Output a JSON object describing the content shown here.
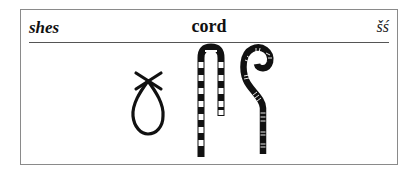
{
  "entry": {
    "transliteration": "shes",
    "meaning": "cord",
    "phonetic": "šś",
    "glyphs": [
      "loop-cord-icon",
      "striped-hook-staff-icon",
      "striped-crook-staff-icon"
    ]
  }
}
